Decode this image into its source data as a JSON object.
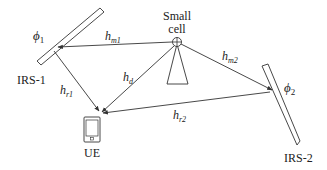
{
  "nodes": {
    "small_cell": {
      "label_line1": "Small",
      "label_line2": "cell"
    },
    "irs1": {
      "label": "IRS-1",
      "phase": "ϕ",
      "phase_sub": "1"
    },
    "irs2": {
      "label": "IRS-2",
      "phase": "ϕ",
      "phase_sub": "2"
    },
    "ue": {
      "label": "UE"
    }
  },
  "links": {
    "hm1": {
      "base": "h",
      "sub": "m1"
    },
    "hm2": {
      "base": "h",
      "sub": "m2"
    },
    "hd": {
      "base": "h",
      "sub": "d"
    },
    "hr1": {
      "base": "h",
      "sub": "r1"
    },
    "hr2": {
      "base": "h",
      "sub": "r2"
    }
  },
  "colors": {
    "stroke": "#333333",
    "text": "#222222"
  }
}
